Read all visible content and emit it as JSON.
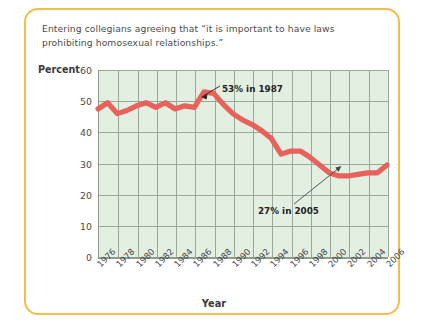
{
  "caption": {
    "line1": "Entering collegians agreeing that “it is important to have laws",
    "line2": "prohibiting homosexual relationships.”"
  },
  "colors": {
    "card_border": "#efc14b",
    "plot_background": "#e3efe1",
    "gridline": "#9aa89a",
    "series_line": "#e8615a",
    "axis": "#8f9c8d",
    "text": "#4a4a4a"
  },
  "chart_data": {
    "type": "line",
    "title": "Entering collegians agreeing that “it is important to have laws prohibiting homosexual relationships.”",
    "xlabel": "Year",
    "ylabel": "Percent",
    "ylim": [
      0,
      60
    ],
    "yticks": [
      0,
      10,
      20,
      30,
      40,
      50,
      60
    ],
    "xlim": [
      1976,
      2006
    ],
    "xticks": [
      1976,
      1978,
      1980,
      1982,
      1984,
      1986,
      1988,
      1990,
      1992,
      1994,
      1996,
      1998,
      2000,
      2002,
      2004,
      2006
    ],
    "grid": true,
    "legend": null,
    "series": [
      {
        "name": "Percent agreeing",
        "x": [
          1976,
          1977,
          1978,
          1979,
          1980,
          1981,
          1982,
          1983,
          1984,
          1985,
          1986,
          1987,
          1988,
          1989,
          1990,
          1991,
          1992,
          1993,
          1994,
          1995,
          1996,
          1997,
          1998,
          1999,
          2000,
          2001,
          2002,
          2003,
          2004,
          2005,
          2006
        ],
        "values": [
          47.5,
          49.5,
          46.0,
          47.0,
          48.5,
          49.5,
          48.0,
          49.5,
          47.5,
          48.5,
          48.0,
          53.0,
          52.5,
          49.0,
          46.0,
          44.0,
          42.5,
          40.5,
          38.0,
          33.0,
          34.0,
          34.0,
          32.0,
          29.5,
          27.0,
          26.0,
          26.0,
          26.5,
          27.0,
          27.0,
          29.5
        ]
      }
    ],
    "annotations": [
      {
        "id": "peak",
        "text": "53% in 1987",
        "year": 1987,
        "value": 53
      },
      {
        "id": "low",
        "text": "27% in 2005",
        "year": 2005,
        "value": 27
      }
    ]
  },
  "axes": {
    "y_title": "Percent",
    "x_title": "Year",
    "y_tick_labels": [
      "60",
      "50",
      "40",
      "30",
      "20",
      "10",
      "0"
    ],
    "x_tick_labels": [
      "1976",
      "1978",
      "1980",
      "1982",
      "1984",
      "1986",
      "1988",
      "1990",
      "1992",
      "1994",
      "1996",
      "1998",
      "2000",
      "2002",
      "2004",
      "2006"
    ]
  },
  "annotations": {
    "peak_label": "53% in 1987",
    "low_label": "27% in 2005"
  }
}
